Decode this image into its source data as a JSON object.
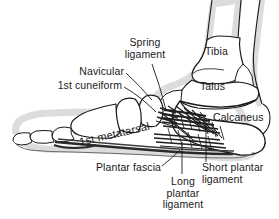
{
  "figure": {
    "background_color": "#ffffff",
    "outline_color": "#1a1a1a",
    "shadow_color": "#d8d8d8",
    "ligament_color": "#242424",
    "text_color": "#1a1a1a"
  },
  "labels": {
    "spring_ligament_line1": "Spring",
    "spring_ligament_line2": "ligament",
    "navicular": "Navicular",
    "first_cuneiform": "1st cuneiform",
    "tibia": "Tibia",
    "talus": "Talus",
    "calcaneus": "Calcaneus",
    "first_metatarsal": "1st metatarsal",
    "plantar_fascia": "Plantar fascia",
    "short_plantar_line1": "Short plantar",
    "short_plantar_line2": "ligament",
    "long_plantar_line1": "Long",
    "long_plantar_line2": "plantar",
    "long_plantar_line3": "ligament"
  },
  "structures": [
    {
      "name": "tibia",
      "type": "bone"
    },
    {
      "name": "talus",
      "type": "bone"
    },
    {
      "name": "calcaneus",
      "type": "bone"
    },
    {
      "name": "navicular",
      "type": "bone"
    },
    {
      "name": "first-cuneiform",
      "type": "bone"
    },
    {
      "name": "first-metatarsal",
      "type": "bone"
    },
    {
      "name": "proximal-phalanx",
      "type": "bone"
    },
    {
      "name": "distal-phalanx",
      "type": "bone"
    },
    {
      "name": "spring-ligament",
      "type": "ligament"
    },
    {
      "name": "long-plantar-ligament",
      "type": "ligament"
    },
    {
      "name": "short-plantar-ligament",
      "type": "ligament"
    },
    {
      "name": "plantar-fascia",
      "type": "ligament"
    }
  ]
}
